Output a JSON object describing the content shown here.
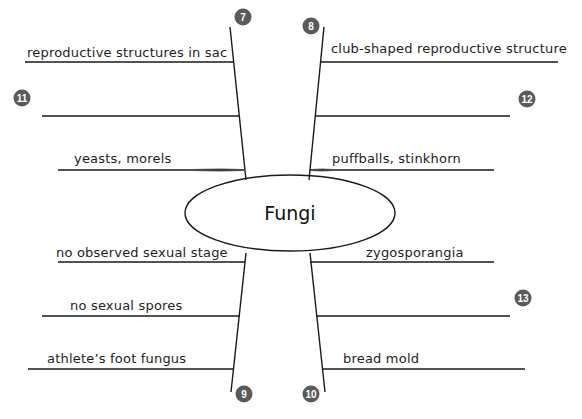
{
  "center": {
    "label": "Fungi"
  },
  "colors": {
    "badge": "#5a5a5a",
    "line": "#1a1a1a",
    "background": "#ffffff"
  },
  "branches": [
    {
      "id": "top-left",
      "badge": "7",
      "items": [
        {
          "text": "reproductive structures in sac"
        },
        {
          "text": "",
          "badge": "11"
        },
        {
          "text": "yeasts, morels"
        }
      ]
    },
    {
      "id": "top-right",
      "badge": "8",
      "items": [
        {
          "text": "club-shaped reproductive structure"
        },
        {
          "text": "",
          "badge": "12"
        },
        {
          "text": "puffballs, stinkhorn"
        }
      ]
    },
    {
      "id": "bottom-left",
      "badge": "9",
      "items": [
        {
          "text": "no observed sexual stage"
        },
        {
          "text": "no sexual spores"
        },
        {
          "text": "athlete’s foot fungus"
        }
      ]
    },
    {
      "id": "bottom-right",
      "badge": "10",
      "items": [
        {
          "text": "zygosporangia"
        },
        {
          "text": "",
          "badge": "13"
        },
        {
          "text": "bread mold"
        }
      ]
    }
  ]
}
